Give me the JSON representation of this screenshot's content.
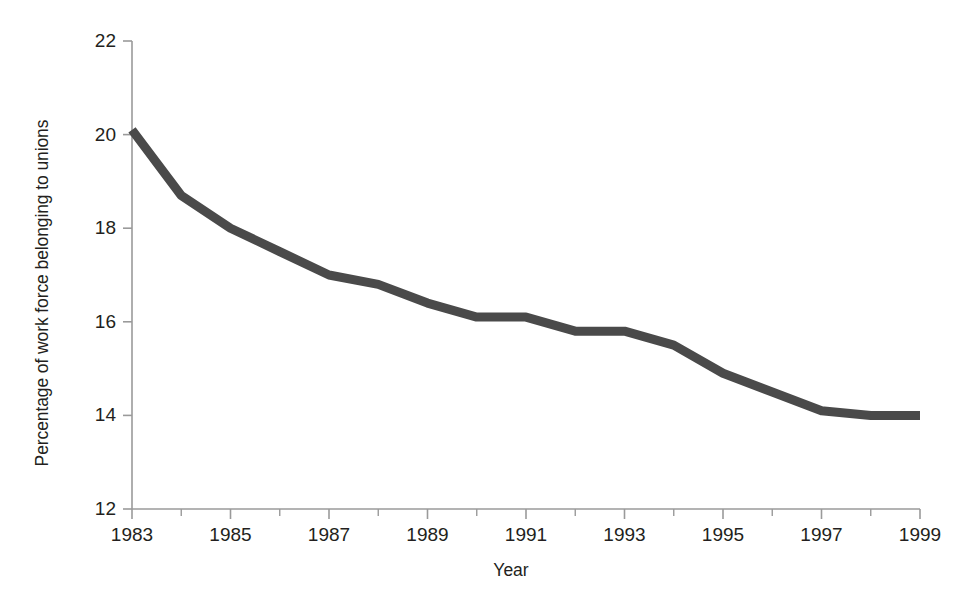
{
  "figure": {
    "background_color": "#ffffff",
    "line_color": "#4a4a4a",
    "axis_color": "#9a9a9a",
    "text_color": "#231f20"
  },
  "margin_artifacts": {
    "frag_1": "e",
    "frag_2": "b",
    "frag_3": ",",
    "frag_4": "."
  },
  "chart_data": {
    "type": "line",
    "title": "",
    "subtitle": "",
    "xlabel": "Year",
    "ylabel": "Percentage of work force belonging to unions",
    "xlim": [
      1983,
      1999
    ],
    "ylim": [
      12,
      22
    ],
    "grid": false,
    "legend": false,
    "legend_position": "none",
    "x_tick_labels": [
      "1983",
      "1985",
      "1987",
      "1989",
      "1991",
      "1993",
      "1995",
      "1997",
      "1999"
    ],
    "x_tick_values": [
      1983,
      1985,
      1987,
      1989,
      1991,
      1993,
      1995,
      1997,
      1999
    ],
    "x_minor_tick_values": [
      1984,
      1986,
      1988,
      1990,
      1992,
      1994,
      1996,
      1998
    ],
    "y_tick_labels": [
      "12",
      "14",
      "16",
      "18",
      "20",
      "22"
    ],
    "y_tick_values": [
      12,
      14,
      16,
      18,
      20,
      22
    ],
    "series": [
      {
        "name": "Percentage of work force belonging to unions",
        "color": "#4a4a4a",
        "line_width": 9,
        "x": [
          1983,
          1984,
          1985,
          1986,
          1987,
          1988,
          1989,
          1990,
          1991,
          1992,
          1993,
          1994,
          1995,
          1996,
          1997,
          1998,
          1999
        ],
        "values": [
          20.1,
          18.7,
          18.0,
          17.5,
          17.0,
          16.8,
          16.4,
          16.1,
          16.1,
          15.8,
          15.8,
          15.5,
          14.9,
          14.5,
          14.1,
          14.0,
          14.0
        ]
      }
    ]
  }
}
